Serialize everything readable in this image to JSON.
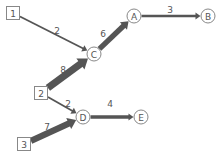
{
  "diagram": {
    "type": "weighted-directed-flow-graph",
    "colors": {
      "edge": "#555555",
      "node_stroke": "#888888",
      "node_fill": "#ffffff",
      "text": "#555555"
    },
    "nodes": [
      {
        "id": "1",
        "label": "1",
        "shape": "square",
        "x": 13,
        "y": 13
      },
      {
        "id": "2",
        "label": "2",
        "shape": "square",
        "x": 41,
        "y": 93
      },
      {
        "id": "3",
        "label": "3",
        "shape": "square",
        "x": 24,
        "y": 144
      },
      {
        "id": "A",
        "label": "A",
        "shape": "circle",
        "x": 134,
        "y": 16
      },
      {
        "id": "B",
        "label": "B",
        "shape": "circle",
        "x": 208,
        "y": 16
      },
      {
        "id": "C",
        "label": "C",
        "shape": "circle",
        "x": 94,
        "y": 54
      },
      {
        "id": "D",
        "label": "D",
        "shape": "circle",
        "x": 83,
        "y": 117
      },
      {
        "id": "E",
        "label": "E",
        "shape": "circle",
        "x": 141,
        "y": 117
      }
    ],
    "edges": [
      {
        "from": "1",
        "to": "C",
        "weight": "2",
        "label_x": 57,
        "label_y": 31
      },
      {
        "from": "C",
        "to": "A",
        "weight": "6",
        "label_x": 103,
        "label_y": 34
      },
      {
        "from": "A",
        "to": "B",
        "weight": "3",
        "label_x": 170,
        "label_y": 10
      },
      {
        "from": "2",
        "to": "C",
        "weight": "8",
        "label_x": 63,
        "label_y": 70
      },
      {
        "from": "2",
        "to": "D",
        "weight": "2",
        "label_x": 68,
        "label_y": 104
      },
      {
        "from": "D",
        "to": "E",
        "weight": "4",
        "label_x": 110,
        "label_y": 104
      },
      {
        "from": "3",
        "to": "D",
        "weight": "7",
        "label_x": 47,
        "label_y": 127
      }
    ]
  }
}
